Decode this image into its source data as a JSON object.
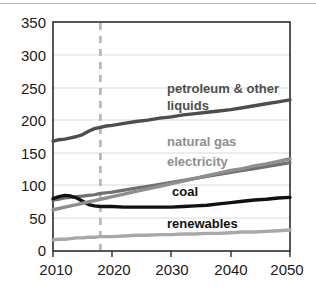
{
  "chart_data": {
    "type": "line",
    "title": "",
    "subtitle": "",
    "xlabel": "",
    "ylabel": "",
    "xlim": [
      2010,
      2050
    ],
    "ylim": [
      0,
      350
    ],
    "grid": true,
    "legend_position": "inline-annotations",
    "x_ticks": [
      "2010",
      "2020",
      "2030",
      "2040",
      "2050"
    ],
    "y_ticks": [
      "0",
      "50",
      "100",
      "150",
      "200",
      "250",
      "300",
      "350"
    ],
    "x": [
      2010,
      2011,
      2012,
      2013,
      2014,
      2015,
      2016,
      2017,
      2018,
      2019,
      2020,
      2022,
      2024,
      2026,
      2028,
      2030,
      2032,
      2034,
      2036,
      2038,
      2040,
      2042,
      2044,
      2046,
      2048,
      2050
    ],
    "annotations": {
      "projection_divider_year": 2018,
      "projection_divider_style": "dashed vertical line"
    },
    "series": [
      {
        "name": "petroleum & other liquids",
        "label": "petroleum & other liquids",
        "color": "#4d4d4d",
        "values": [
          168,
          170,
          171,
          173,
          175,
          178,
          183,
          187,
          189,
          191,
          192,
          195,
          198,
          200,
          203,
          205,
          208,
          210,
          212,
          214,
          216,
          219,
          222,
          225,
          228,
          231
        ]
      },
      {
        "name": "natural gas",
        "label": "natural gas",
        "color": "#8e8e8e",
        "values": [
          63,
          65,
          67,
          69,
          71,
          73,
          75,
          77,
          79,
          81,
          83,
          87,
          91,
          95,
          99,
          103,
          107,
          111,
          115,
          119,
          123,
          126,
          130,
          133,
          137,
          141
        ]
      },
      {
        "name": "electricity",
        "label": "electricity",
        "color": "#6f6f6f",
        "values": [
          78,
          79,
          81,
          82,
          83,
          84,
          85,
          86,
          88,
          89,
          90,
          93,
          96,
          99,
          102,
          105,
          108,
          111,
          114,
          117,
          120,
          123,
          126,
          129,
          132,
          135
        ]
      },
      {
        "name": "coal",
        "label": "coal",
        "color": "#111111",
        "values": [
          80,
          83,
          85,
          84,
          81,
          76,
          71,
          69,
          68,
          68,
          68,
          67,
          67,
          67,
          67,
          67,
          68,
          69,
          70,
          72,
          74,
          76,
          78,
          79,
          81,
          82
        ]
      },
      {
        "name": "renewables",
        "label": "renewables",
        "color": "#a8a8a8",
        "values": [
          17,
          18,
          18,
          19,
          20,
          20,
          21,
          21,
          22,
          22,
          22,
          23,
          24,
          24,
          25,
          25,
          26,
          26,
          27,
          27,
          28,
          29,
          29,
          30,
          31,
          32
        ]
      }
    ]
  },
  "labels": {
    "petroleum_line1": "petroleum & other",
    "petroleum_line2": "liquids",
    "natural_gas": "natural gas",
    "electricity": "electricity",
    "coal": "coal",
    "renewables": "renewables"
  },
  "axes": {
    "y_ticks": [
      "350",
      "300",
      "250",
      "200",
      "150",
      "100",
      "50",
      "0"
    ],
    "x_ticks": [
      "2010",
      "2020",
      "2030",
      "2040",
      "2050"
    ]
  }
}
